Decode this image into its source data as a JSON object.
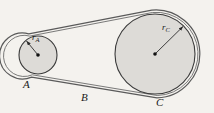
{
  "figure": {
    "kind": "belt-and-pulley-diagram",
    "width": 214,
    "height": 113,
    "background_color": "#f4f2ee",
    "ink_color": "#2b2b2b",
    "disk_fill_color": "#dcdcdc",
    "belt_color": "#555555"
  },
  "labels": {
    "pulley_a": "A",
    "belt_point_b": "B",
    "pulley_c": "C",
    "radius_a_symbol": "r",
    "radius_a_subscript": "A",
    "radius_c_symbol": "r",
    "radius_c_subscript": "C"
  },
  "geometry": {
    "small_pulley": {
      "name": "A",
      "center_x": 38,
      "center_y": 55,
      "disk_radius": 19,
      "belt_radius": 23
    },
    "large_pulley": {
      "name": "C",
      "center_x": 155,
      "center_y": 54,
      "disk_radius": 40,
      "belt_radius": 44
    },
    "radius_arrow_a": {
      "from_x": 38,
      "from_y": 55,
      "to_x": 26,
      "to_y": 40
    },
    "radius_arrow_c": {
      "from_x": 155,
      "from_y": 54,
      "to_x": 184,
      "to_y": 26
    },
    "center_dot_radius": 1.8
  }
}
